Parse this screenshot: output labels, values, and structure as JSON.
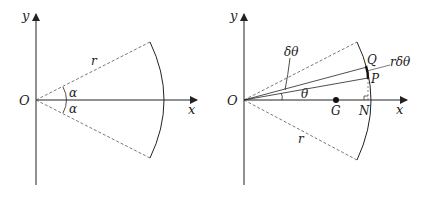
{
  "figures": [
    {
      "id": "left",
      "description": "Circular sector of radius r with half-angle alpha about the x-axis",
      "labels": {
        "y_axis": "y",
        "x_axis": "x",
        "origin": "O",
        "radius": "r",
        "angle_upper": "α",
        "angle_lower": "α"
      }
    },
    {
      "id": "right",
      "description": "Sector with elemental strip PQ at angle theta, centroid G and foot N on x-axis",
      "labels": {
        "y_axis": "y",
        "x_axis": "x",
        "origin": "O",
        "radius": "r",
        "delta_theta": "δθ",
        "theta": "θ",
        "point_q": "Q",
        "point_p": "P",
        "arc_length": "rδθ",
        "centroid": "G",
        "foot": "N"
      }
    }
  ],
  "colors": {
    "line": "#222222",
    "background": "#ffffff"
  }
}
